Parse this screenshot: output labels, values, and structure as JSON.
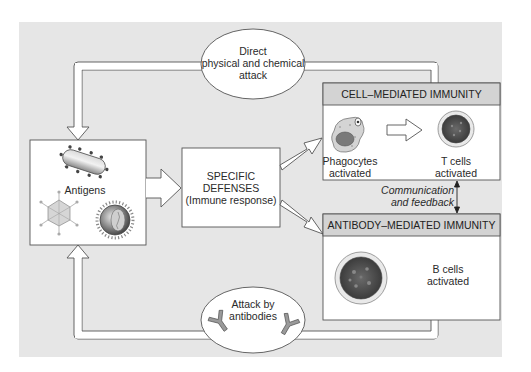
{
  "diagram": {
    "background_color": "#e6e6e6",
    "nodes": {
      "direct_attack": {
        "line1": "Direct",
        "line2": "physical and chemical",
        "line3": "attack"
      },
      "antigens": {
        "label": "Antigens"
      },
      "specific_defenses": {
        "line1": "SPECIFIC",
        "line2": "DEFENSES",
        "line3": "(Immune response)"
      },
      "cell_mediated": {
        "header": "CELL–MEDIATED IMMUNITY",
        "phagocytes_line1": "Phagocytes",
        "phagocytes_line2": "activated",
        "tcells_line1": "T cells",
        "tcells_line2": "activated"
      },
      "communication": {
        "line1": "Communication",
        "line2": "and feedback"
      },
      "antibody_mediated": {
        "header": "ANTIBODY–MEDIATED IMMUNITY",
        "bcells_line1": "B cells",
        "bcells_line2": "activated"
      },
      "attack_by_antibodies": {
        "line1": "Attack by",
        "line2": "antibodies"
      }
    },
    "edges": [
      {
        "from": "antigens",
        "to": "specific_defenses"
      },
      {
        "from": "specific_defenses",
        "to": "cell_mediated"
      },
      {
        "from": "specific_defenses",
        "to": "antibody_mediated"
      },
      {
        "from": "phagocytes",
        "to": "t_cells"
      },
      {
        "from": "cell_mediated",
        "to": "antibody_mediated",
        "label": "Communication and feedback",
        "bidirectional": true
      },
      {
        "from": "cell_mediated",
        "to": "antigens",
        "via": "direct_attack"
      },
      {
        "from": "antibody_mediated",
        "to": "antigens",
        "via": "attack_by_antibodies"
      }
    ],
    "colors": {
      "panel": "#e6e6e6",
      "box_fill": "#ffffff",
      "stroke": "#555555",
      "header_fill": "#d0d0d0"
    }
  }
}
